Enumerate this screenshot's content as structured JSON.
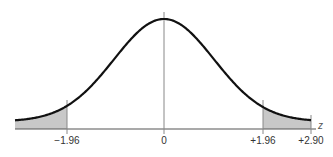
{
  "chart_data": {
    "type": "line",
    "title": "",
    "xlabel": "z",
    "ylabel": "",
    "xlim": [
      -3.0,
      2.95
    ],
    "tick_labels": [
      "−1.96",
      "0",
      "+1.96",
      "+2.90"
    ],
    "tick_values": [
      -1.96,
      0,
      1.96,
      2.9
    ],
    "shaded_regions": [
      {
        "from": -3.0,
        "to": -1.96,
        "label": "left tail"
      },
      {
        "from": 1.96,
        "to": 2.9,
        "label": "right tail"
      }
    ],
    "vertical_lines": [
      -1.96,
      0,
      1.96,
      2.9
    ],
    "colors": {
      "curve": "#111111",
      "shade": "#c8c8c8",
      "axis": "#555555",
      "vline": "#777777"
    },
    "grid": false,
    "legend": null
  },
  "labels": {
    "neg196": "−1.96",
    "zero": "0",
    "pos196": "+1.96",
    "pos290": "+2.90",
    "axis": "z"
  }
}
